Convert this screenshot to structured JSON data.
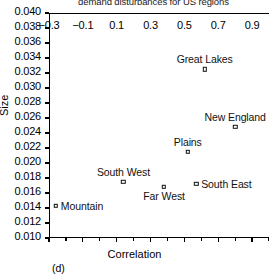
{
  "chart_data": {
    "type": "scatter",
    "title": "demand disturbances for US regions",
    "panel_label": "(d)",
    "xlabel": "Correlation",
    "ylabel": "Size",
    "xlim": [
      -0.3,
      1.0
    ],
    "ylim": [
      0.01,
      0.04
    ],
    "xticks": [
      -0.3,
      -0.2,
      -0.1,
      0.0,
      0.1,
      0.2,
      0.3,
      0.4,
      0.5,
      0.6,
      0.7,
      0.8,
      0.9,
      1.0
    ],
    "xtick_labels": [
      "−0.3",
      "",
      "−0.1",
      "",
      "0.1",
      "",
      "0.3",
      "",
      "0.5",
      "",
      "0.7",
      "",
      "0.9",
      ""
    ],
    "yticks": [
      0.01,
      0.012,
      0.014,
      0.016,
      0.018,
      0.02,
      0.022,
      0.024,
      0.026,
      0.028,
      0.03,
      0.032,
      0.034,
      0.036,
      0.038,
      0.04
    ],
    "ytick_labels": [
      "0.010",
      "0.012",
      "0.014",
      "0.016",
      "0.018",
      "0.020",
      "0.022",
      "0.024",
      "0.026",
      "0.028",
      "0.030",
      "0.032",
      "0.034",
      "0.036",
      "0.038",
      "0.040"
    ],
    "grid": false,
    "legend": "none",
    "marker": "open-square",
    "marker_color": "#111111",
    "points": [
      {
        "label": "Great Lakes",
        "x": 0.62,
        "y": 0.0325,
        "label_pos": "above"
      },
      {
        "label": "New England",
        "x": 0.8,
        "y": 0.0248,
        "label_pos": "above"
      },
      {
        "label": "Plains",
        "x": 0.52,
        "y": 0.0215,
        "label_pos": "above"
      },
      {
        "label": "South East",
        "x": 0.57,
        "y": 0.0172,
        "label_pos": "right"
      },
      {
        "label": "South West",
        "x": 0.14,
        "y": 0.0175,
        "label_pos": "above"
      },
      {
        "label": "Far West",
        "x": 0.38,
        "y": 0.0168,
        "label_pos": "below"
      },
      {
        "label": "Mountain",
        "x": -0.26,
        "y": 0.0143,
        "label_pos": "right"
      }
    ]
  }
}
